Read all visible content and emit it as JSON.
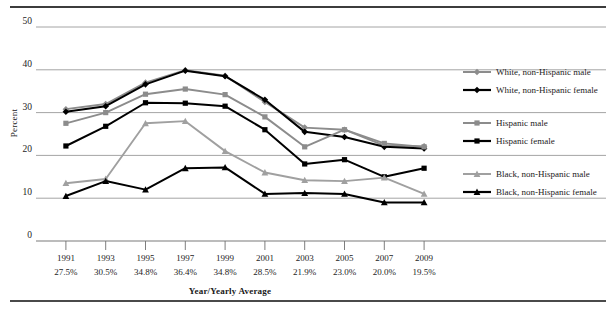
{
  "figure": {
    "ylabel": "Percent",
    "xlabel": "Year/Yearly Average"
  },
  "legend": {
    "items": [
      {
        "label": "White, non-Hispanic male",
        "color": "#8c8c8c",
        "marker": "diamond"
      },
      {
        "label": "White, non-Hispanic female",
        "color": "#000000",
        "marker": "diamond"
      },
      {
        "label": "Hispanic male",
        "color": "#8c8c8c",
        "marker": "square"
      },
      {
        "label": "Hispanic female",
        "color": "#000000",
        "marker": "square"
      },
      {
        "label": "Black, non-Hispanic male",
        "color": "#a0a0a0",
        "marker": "triangle"
      },
      {
        "label": "Black, non-Hispanic female",
        "color": "#000000",
        "marker": "triangle"
      }
    ]
  },
  "chart_data": {
    "type": "line",
    "title": "",
    "xlabel": "Year/Yearly Average",
    "ylabel": "Percent",
    "ylim": [
      0,
      50
    ],
    "yticks": [
      0,
      10,
      20,
      30,
      40,
      50
    ],
    "ytick_labels": [
      "0",
      "10",
      "20",
      "30",
      "40",
      "50"
    ],
    "grid": true,
    "legend_position": "right",
    "categories": [
      "1991",
      "1993",
      "1995",
      "1997",
      "1999",
      "2001",
      "2003",
      "2005",
      "2007",
      "2009"
    ],
    "x": [
      1991,
      1993,
      1995,
      1997,
      1999,
      2001,
      2003,
      2005,
      2007,
      2009
    ],
    "yearly_average": [
      "27.5%",
      "30.5%",
      "34.8%",
      "36.4%",
      "34.8%",
      "28.5%",
      "21.9%",
      "23.0%",
      "20.0%",
      "19.5%"
    ],
    "series": [
      {
        "name": "White, non-Hispanic male",
        "color": "#8c8c8c",
        "marker": "diamond",
        "values": [
          30.8,
          32.0,
          37.0,
          39.9,
          38.6,
          32.5,
          26.5,
          26.0,
          22.3,
          22.1
        ]
      },
      {
        "name": "White, non-Hispanic female",
        "color": "#000000",
        "marker": "diamond",
        "values": [
          30.2,
          31.5,
          36.6,
          39.8,
          38.5,
          33.0,
          25.5,
          24.3,
          22.0,
          21.6
        ]
      },
      {
        "name": "Hispanic male",
        "color": "#8c8c8c",
        "marker": "square",
        "values": [
          27.5,
          30.0,
          34.3,
          35.5,
          34.2,
          29.0,
          22.0,
          26.0,
          22.8,
          22.0
        ]
      },
      {
        "name": "Hispanic female",
        "color": "#000000",
        "marker": "square",
        "values": [
          22.2,
          26.8,
          32.3,
          32.2,
          31.5,
          26.0,
          18.0,
          19.0,
          15.0,
          17.0
        ]
      },
      {
        "name": "Black, non-Hispanic male",
        "color": "#a0a0a0",
        "marker": "triangle",
        "values": [
          13.5,
          14.5,
          27.5,
          28.0,
          21.0,
          16.0,
          14.2,
          14.0,
          14.8,
          11.0
        ]
      },
      {
        "name": "Black, non-Hispanic female",
        "color": "#000000",
        "marker": "triangle",
        "values": [
          10.5,
          14.0,
          12.0,
          17.0,
          17.2,
          11.0,
          11.2,
          11.0,
          9.0,
          9.0
        ]
      }
    ]
  }
}
